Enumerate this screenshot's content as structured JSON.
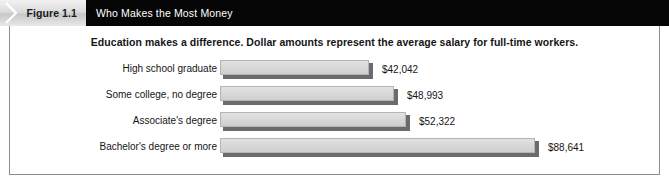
{
  "figure": {
    "tab_label": "Figure 1.1",
    "header_title": "Who Makes the Most Money",
    "chevron_icon": "chevron-right-icon"
  },
  "chart_data": {
    "type": "bar",
    "orientation": "horizontal",
    "title": "Education makes a difference. Dollar amounts represent the average salary for full-time workers.",
    "xlabel": "",
    "ylabel": "",
    "grid": false,
    "legend": null,
    "categories": [
      "High school graduate",
      "Some college, no degree",
      "Associate's degree",
      "Bachelor's degree or more"
    ],
    "values": [
      42042,
      48993,
      52322,
      88641
    ],
    "value_labels": [
      "$42,042",
      "$48,993",
      "$52,322",
      "$88,641"
    ],
    "xlim": [
      0,
      100000
    ]
  },
  "colors": {
    "header_bar": "#050505",
    "tab_background": "#dcdcdc",
    "bar_fill": "#d8d8d8",
    "bar_shadow": "#6b6b6b",
    "frame_border": "#8c8c8c",
    "text": "#151515"
  }
}
